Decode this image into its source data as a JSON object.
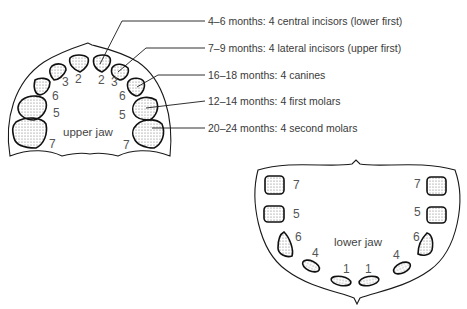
{
  "legend": [
    {
      "text": "4–6 months: 4 central incisors (lower first)",
      "tooth_number": 1
    },
    {
      "text": "7–9 months: 4 lateral incisors (upper first)",
      "tooth_number": 2
    },
    {
      "text": "16–18 months: 4 canines",
      "tooth_number": 6
    },
    {
      "text": "12–14 months: 4 first molars",
      "tooth_number": 5
    },
    {
      "text": "20–24 months: 4 second molars",
      "tooth_number": 7
    }
  ],
  "upper_jaw": {
    "label": "upper jaw",
    "tooth_numbers": {
      "left": [
        "7",
        "5",
        "6",
        "3",
        "2"
      ],
      "right": [
        "2",
        "3",
        "6",
        "5",
        "7"
      ]
    }
  },
  "lower_jaw": {
    "label": "lower jaw",
    "tooth_numbers": {
      "left": [
        "7",
        "5",
        "6",
        "4",
        "1"
      ],
      "right": [
        "1",
        "4",
        "6",
        "5",
        "7"
      ]
    }
  },
  "colors": {
    "line": "#1a1a1a",
    "text": "#3a3a3a"
  }
}
